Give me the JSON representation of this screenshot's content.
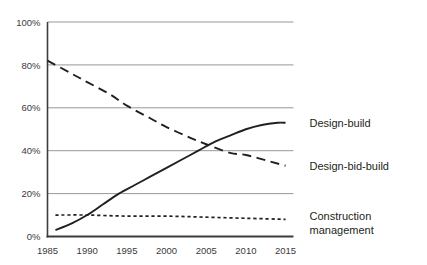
{
  "chart_data": {
    "type": "line",
    "title": "",
    "subtitle": "",
    "xlabel": "",
    "ylabel": "",
    "xlim": [
      1985,
      2016
    ],
    "ylim": [
      0,
      100
    ],
    "grid": "horizontal",
    "legend_position": "right-inline-at-line-end",
    "x_tick_labels": [
      "1985",
      "1990",
      "1995",
      "2000",
      "2005",
      "2010",
      "2015"
    ],
    "x_ticks": [
      1985,
      1990,
      1995,
      2000,
      2005,
      2010,
      2015
    ],
    "y_tick_labels": [
      "0%",
      "20%",
      "40%",
      "60%",
      "80%",
      "100%"
    ],
    "y_ticks": [
      0,
      20,
      40,
      60,
      80,
      100
    ],
    "series": [
      {
        "name": "Design-build",
        "style": "solid",
        "color": "#231f20",
        "label": "Design-build",
        "x": [
          1986,
          1988,
          1990,
          1992,
          1994,
          1996,
          1998,
          2000,
          2002,
          2004,
          2006,
          2008,
          2010,
          2012,
          2014,
          2015
        ],
        "values": [
          3,
          6,
          10,
          15,
          20,
          24,
          28,
          32,
          36,
          40,
          44,
          47,
          50,
          52,
          53,
          53
        ]
      },
      {
        "name": "Design-bid-build",
        "style": "dashed",
        "color": "#231f20",
        "label": "Design-bid-build",
        "x": [
          1985,
          1988,
          1990,
          1993,
          1995,
          1998,
          2000,
          2003,
          2005,
          2008,
          2010,
          2013,
          2015
        ],
        "values": [
          82,
          76,
          72,
          66,
          61,
          55,
          51,
          46,
          43,
          39,
          38,
          35,
          33
        ]
      },
      {
        "name": "Construction management",
        "style": "dotted",
        "color": "#231f20",
        "label": "Construction management",
        "label_line1": "Construction",
        "label_line2": "management",
        "x": [
          1986,
          1990,
          1995,
          2000,
          2005,
          2010,
          2015
        ],
        "values": [
          10,
          10,
          9.5,
          9.5,
          9,
          8.5,
          8
        ]
      }
    ],
    "colors": {
      "line": "#231f20",
      "gridline": "#8c8c8c",
      "axis": "#3c3c3c",
      "text": "#231f20",
      "background": "#ffffff"
    }
  }
}
